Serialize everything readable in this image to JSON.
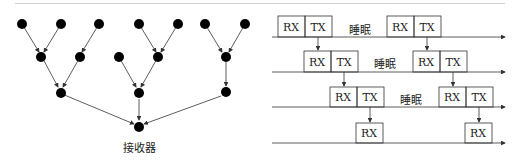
{
  "tree": {
    "receiver_label": "接收器",
    "node_color": "#000000",
    "edge_color": "#333333"
  },
  "timing": {
    "rx_label": "RX",
    "tx_label": "TX",
    "sleep_label": "睡眠",
    "rows": 4
  }
}
